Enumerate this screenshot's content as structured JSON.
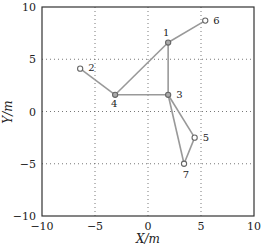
{
  "chart_data": {
    "type": "scatter",
    "title": "",
    "xlabel": "X/m",
    "ylabel": "Y/m",
    "xlim": [
      -10,
      10
    ],
    "ylim": [
      -10,
      10
    ],
    "xticks": [
      -10,
      -5,
      0,
      5,
      10
    ],
    "yticks": [
      -10,
      -5,
      0,
      5,
      10
    ],
    "xtick_labels": [
      "−10",
      "−5",
      "0",
      "5",
      "10"
    ],
    "ytick_labels": [
      "−10",
      "−5",
      "0",
      "5",
      "10"
    ],
    "grid": true,
    "grid_style": "dotted",
    "legend": null,
    "nodes": [
      {
        "id": "1",
        "x": 1.9,
        "y": 6.6,
        "filled": true
      },
      {
        "id": "2",
        "x": -6.4,
        "y": 4.1,
        "filled": false
      },
      {
        "id": "3",
        "x": 1.9,
        "y": 1.6,
        "filled": true
      },
      {
        "id": "4",
        "x": -3.1,
        "y": 1.6,
        "filled": true
      },
      {
        "id": "5",
        "x": 4.4,
        "y": -2.5,
        "filled": false
      },
      {
        "id": "6",
        "x": 5.4,
        "y": 8.7,
        "filled": false
      },
      {
        "id": "7",
        "x": 3.4,
        "y": -5.0,
        "filled": false
      }
    ],
    "edges": [
      [
        "2",
        "4"
      ],
      [
        "4",
        "3"
      ],
      [
        "4",
        "1"
      ],
      [
        "1",
        "3"
      ],
      [
        "1",
        "6"
      ],
      [
        "3",
        "5"
      ],
      [
        "3",
        "7"
      ],
      [
        "5",
        "7"
      ]
    ],
    "colors": {
      "edge": "#999999",
      "node_stroke": "#666666",
      "node_fill": "#aaaaaa",
      "axis": "#333333",
      "grid": "#555555"
    }
  }
}
